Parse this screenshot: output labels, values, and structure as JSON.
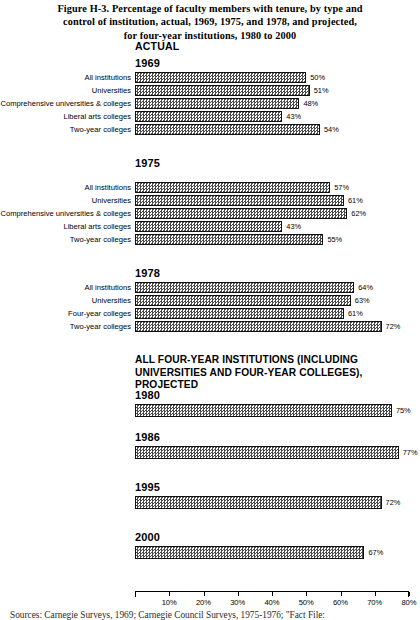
{
  "caption": {
    "lines": [
      "Figure H-3. Percentage of faculty members with tenure, by type and",
      "control of institution, actual, 1969, 1975, and 1978, and projected,",
      "for four-year institutions, 1980 to 2000"
    ]
  },
  "sections": {
    "actual_label": "ACTUAL",
    "projected_label_lines": [
      "ALL FOUR-YEAR INSTITUTIONS (INCLUDING",
      "UNIVERSITIES AND FOUR-YEAR COLLEGES),",
      "PROJECTED"
    ]
  },
  "groups": {
    "g1969": {
      "heading": "1969",
      "rows": [
        {
          "label": "All institutions",
          "value": 50,
          "value_label": "50%"
        },
        {
          "label": "Universities",
          "value": 51,
          "value_label": "51%"
        },
        {
          "label": "Comprehensive universities & colleges",
          "value": 48,
          "value_label": "48%"
        },
        {
          "label": "Liberal arts colleges",
          "value": 43,
          "value_label": "43%"
        },
        {
          "label": "Two-year colleges",
          "value": 54,
          "value_label": "54%"
        }
      ]
    },
    "g1975": {
      "heading": "1975",
      "rows": [
        {
          "label": "All institutions",
          "value": 57,
          "value_label": "57%"
        },
        {
          "label": "Universities",
          "value": 61,
          "value_label": "61%"
        },
        {
          "label": "Comprehensive universities & colleges",
          "value": 62,
          "value_label": "62%"
        },
        {
          "label": "Liberal arts colleges",
          "value": 43,
          "value_label": "43%"
        },
        {
          "label": "Two-year colleges",
          "value": 55,
          "value_label": "55%"
        }
      ]
    },
    "g1978": {
      "heading": "1978",
      "rows": [
        {
          "label": "All institutions",
          "value": 64,
          "value_label": "64%"
        },
        {
          "label": "Universities",
          "value": 63,
          "value_label": "63%"
        },
        {
          "label": "Four-year colleges",
          "value": 61,
          "value_label": "61%"
        },
        {
          "label": "Two-year colleges",
          "value": 72,
          "value_label": "72%"
        }
      ]
    },
    "projected": [
      {
        "heading": "1980",
        "value": 75,
        "value_label": "75%"
      },
      {
        "heading": "1986",
        "value": 77,
        "value_label": "77%"
      },
      {
        "heading": "1995",
        "value": 72,
        "value_label": "72%"
      },
      {
        "heading": "2000",
        "value": 67,
        "value_label": "67%"
      }
    ]
  },
  "axis": {
    "min": 0,
    "max": 80,
    "ticks": [
      10,
      20,
      30,
      40,
      50,
      60,
      70,
      80
    ],
    "tick_labels": [
      "10%",
      "20%",
      "30%",
      "40%",
      "50%",
      "60%",
      "70%",
      "80%"
    ]
  },
  "source": "Sources: Carnegie Surveys, 1969; Carnegie Council Surveys, 1975-1976; \"Fact File:",
  "colors": {
    "ink": "#000000",
    "bar_fill_dark": "#4a4a4a",
    "bar_fill_light": "#ffffff",
    "background": "#ffffff"
  },
  "chart_data": {
    "type": "bar",
    "title": "Figure H-3. Percentage of faculty members with tenure, by type and control of institution, actual, 1969, 1975, and 1978, and projected, for four-year institutions, 1980 to 2000",
    "orientation": "horizontal",
    "xlabel": "",
    "ylabel": "",
    "xlim": [
      0,
      80
    ],
    "xticks": [
      10,
      20,
      30,
      40,
      50,
      60,
      70,
      80
    ],
    "xtick_labels": [
      "10%",
      "20%",
      "30%",
      "40%",
      "50%",
      "60%",
      "70%",
      "80%"
    ],
    "grid": false,
    "legend": "none",
    "units": "percent",
    "panels": [
      {
        "panel_label": "ACTUAL",
        "group": "1969",
        "categories": [
          "All institutions",
          "Universities",
          "Comprehensive universities & colleges",
          "Liberal arts colleges",
          "Two-year colleges"
        ],
        "values": [
          50,
          51,
          48,
          43,
          54
        ]
      },
      {
        "panel_label": "ACTUAL",
        "group": "1975",
        "categories": [
          "All institutions",
          "Universities",
          "Comprehensive universities & colleges",
          "Liberal arts colleges",
          "Two-year colleges"
        ],
        "values": [
          57,
          61,
          62,
          43,
          55
        ]
      },
      {
        "panel_label": "ACTUAL",
        "group": "1978",
        "categories": [
          "All institutions",
          "Universities",
          "Four-year colleges",
          "Two-year colleges"
        ],
        "values": [
          64,
          63,
          61,
          72
        ]
      },
      {
        "panel_label": "ALL FOUR-YEAR INSTITUTIONS (INCLUDING UNIVERSITIES AND FOUR-YEAR COLLEGES), PROJECTED",
        "group": "projected",
        "categories": [
          "1980",
          "1986",
          "1995",
          "2000"
        ],
        "values": [
          75,
          77,
          72,
          67
        ]
      }
    ],
    "annotations": [
      "Sources: Carnegie Surveys, 1969; Carnegie Council Surveys, 1975-1976; \"Fact File:"
    ]
  }
}
